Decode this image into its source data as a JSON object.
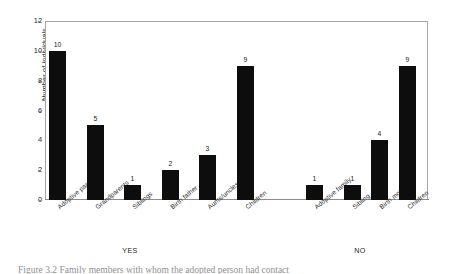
{
  "figure": {
    "caption_partial": "Figure 3.2  Family members with whom the adopted person had contact"
  },
  "chart_data": {
    "type": "bar",
    "title": "",
    "xlabel": "",
    "ylabel": "Number of individuals",
    "ylim": [
      0,
      12
    ],
    "yticks": [
      0,
      2,
      4,
      6,
      8,
      10,
      12
    ],
    "grid": false,
    "legend": false,
    "bar_color": "#0d0d0d",
    "groups": [
      {
        "name": "YES",
        "categories": [
          "Adoptive parents",
          "Grandparents",
          "Siblings",
          "Birth father",
          "Aunts/uncles",
          "Children"
        ],
        "values": [
          10,
          5,
          1,
          2,
          3,
          9
        ]
      },
      {
        "name": "NO",
        "categories": [
          "Adoptive family",
          "Sibling",
          "Birth mother",
          "Children"
        ],
        "values": [
          1,
          1,
          4,
          9
        ]
      }
    ],
    "categories": [
      "Adoptive parents",
      "Grandparents",
      "Siblings",
      "Birth father",
      "Aunts/uncles",
      "Children",
      "Adoptive family",
      "Sibling",
      "Birth mother",
      "Children"
    ],
    "values": [
      10,
      5,
      1,
      2,
      3,
      9,
      1,
      1,
      4,
      9
    ]
  }
}
